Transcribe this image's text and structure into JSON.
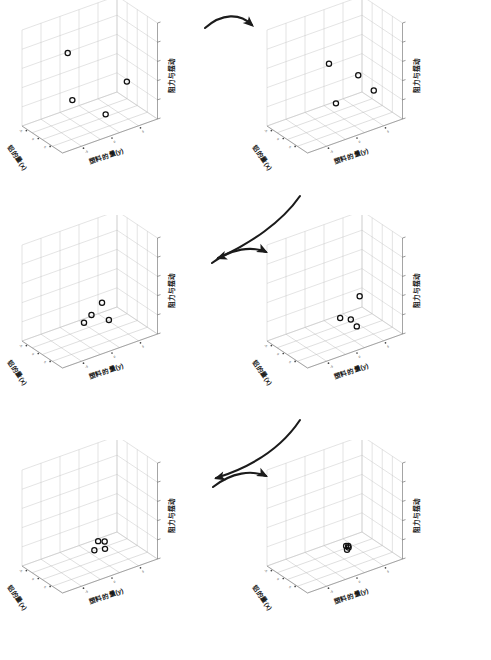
{
  "figure": {
    "kind": "3d-scatter-sequence",
    "panel_count": 6,
    "axis_labels": {
      "x": "铝的量(x)",
      "y": "塑料的量(y)",
      "z": "阻力与摆动"
    },
    "tick_labels": {
      "x": [
        "-5",
        "0",
        "5"
      ],
      "y": [
        "-5",
        "0",
        "5"
      ]
    },
    "colors": {
      "grid": "#b8b8b8",
      "axis": "#7a7a7a",
      "marker": "#101010",
      "arrow": "#1b1b1b",
      "background": "#ffffff"
    },
    "marker_symbol": "o"
  },
  "chart_data": {
    "type": "scatter",
    "title": "",
    "xlabel": "铝的量(x)",
    "ylabel": "塑料的量(y)",
    "zlabel": "阻力与摆动",
    "xlim": [
      -7.5,
      7.5
    ],
    "ylim": [
      -7.5,
      7.5
    ],
    "zlim": [
      0,
      100
    ],
    "grid": true,
    "legend": "none",
    "panels": [
      {
        "index": 1,
        "label": "迭代 1",
        "points": [
          {
            "x": -3.0,
            "y": -2.2,
            "z": 72
          },
          {
            "x": 4.6,
            "y": 3.9,
            "z": 42
          },
          {
            "x": -4.1,
            "y": -1.0,
            "z": 18
          },
          {
            "x": 1.2,
            "y": 2.0,
            "z": 6
          }
        ]
      },
      {
        "index": 2,
        "label": "迭代 2",
        "points": [
          {
            "x": -1.2,
            "y": -0.4,
            "z": 60
          },
          {
            "x": 2.6,
            "y": 2.6,
            "z": 48
          },
          {
            "x": 4.6,
            "y": 4.2,
            "z": 32
          },
          {
            "x": -1.9,
            "y": 1.0,
            "z": 14
          }
        ]
      },
      {
        "index": 3,
        "label": "迭代 3",
        "points": [
          {
            "x": 2.2,
            "y": 1.0,
            "z": 38
          },
          {
            "x": -0.3,
            "y": 0.4,
            "z": 22
          },
          {
            "x": 2.4,
            "y": 2.0,
            "z": 18
          },
          {
            "x": -2.6,
            "y": 0.2,
            "z": 10
          }
        ]
      },
      {
        "index": 4,
        "label": "迭代 4",
        "points": [
          {
            "x": 3.6,
            "y": 2.4,
            "z": 44
          },
          {
            "x": 0.6,
            "y": 0.6,
            "z": 20
          },
          {
            "x": 2.2,
            "y": 1.6,
            "z": 19
          },
          {
            "x": 3.0,
            "y": 2.2,
            "z": 12
          }
        ]
      },
      {
        "index": 5,
        "label": "迭代 5",
        "points": [
          {
            "x": 1.0,
            "y": 0.9,
            "z": 22
          },
          {
            "x": 2.0,
            "y": 1.5,
            "z": 22
          },
          {
            "x": 1.9,
            "y": 1.6,
            "z": 14
          },
          {
            "x": 0.3,
            "y": 0.6,
            "z": 12
          }
        ]
      },
      {
        "index": 6,
        "label": "迭代 6",
        "points": [
          {
            "x": 1.4,
            "y": 1.2,
            "z": 17
          },
          {
            "x": 1.7,
            "y": 1.4,
            "z": 17
          },
          {
            "x": 1.6,
            "y": 1.5,
            "z": 15
          },
          {
            "x": 1.5,
            "y": 1.3,
            "z": 13
          }
        ]
      }
    ]
  },
  "arrows": [
    {
      "id": "arrow-1-2",
      "from_panel": 1,
      "to_panel": 2,
      "direction": "right"
    },
    {
      "id": "arrow-2-3",
      "from_panel": 2,
      "to_panel": 3,
      "direction": "down-left"
    },
    {
      "id": "arrow-3-4",
      "from_panel": 3,
      "to_panel": 4,
      "direction": "right"
    },
    {
      "id": "arrow-4-5",
      "from_panel": 4,
      "to_panel": 5,
      "direction": "down-left"
    },
    {
      "id": "arrow-5-6",
      "from_panel": 5,
      "to_panel": 6,
      "direction": "right"
    }
  ]
}
